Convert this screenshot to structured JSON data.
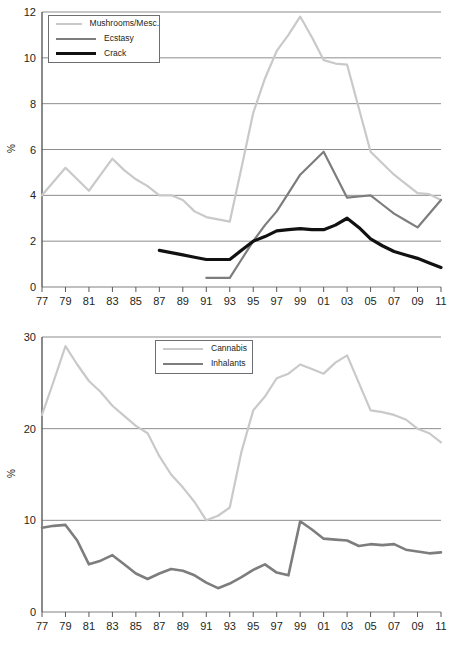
{
  "figure": {
    "background": "#ffffff",
    "colors": {
      "light_gray": "#c9c9c9",
      "medium_gray": "#7d7d7d",
      "black": "#111111",
      "gridline": "#808080",
      "axis": "#58595b",
      "text": "#231f20"
    }
  },
  "chart_data": [
    {
      "id": "top",
      "type": "line",
      "title": "",
      "xlabel": "",
      "ylabel": "%",
      "grid": true,
      "legend_position": "top-left",
      "xlim": [
        1977,
        2011
      ],
      "ylim": [
        0,
        12
      ],
      "yticks": [
        0,
        2,
        4,
        6,
        8,
        10,
        12
      ],
      "ytick_labels": [
        "0",
        "2",
        "4",
        "6",
        "8",
        "10",
        "12"
      ],
      "x": [
        1977,
        1978,
        1979,
        1980,
        1981,
        1982,
        1983,
        1984,
        1985,
        1986,
        1987,
        1988,
        1989,
        1990,
        1991,
        1992,
        1993,
        1994,
        1995,
        1996,
        1997,
        1998,
        1999,
        2000,
        2001,
        2002,
        2003,
        2004,
        2005,
        2006,
        2007,
        2008,
        2009,
        2010,
        2011
      ],
      "xtick_values": [
        1977,
        1979,
        1981,
        1983,
        1985,
        1987,
        1989,
        1991,
        1993,
        1995,
        1997,
        1999,
        2001,
        2003,
        2005,
        2007,
        2009,
        2011
      ],
      "xtick_labels": [
        "77",
        "79",
        "81",
        "83",
        "85",
        "87",
        "89",
        "91",
        "93",
        "95",
        "97",
        "99",
        "01",
        "03",
        "05",
        "07",
        "09",
        "11"
      ],
      "series": [
        {
          "name": "Mushrooms/Mesc.",
          "color": "#c9c9c9",
          "width": 2.2,
          "values": [
            4.0,
            4.6,
            5.2,
            4.7,
            4.2,
            4.9,
            5.6,
            5.1,
            4.7,
            4.4,
            4.0,
            4.0,
            3.8,
            3.3,
            3.05,
            2.95,
            2.85,
            5.2,
            7.6,
            9.1,
            10.3,
            11.0,
            11.8,
            10.9,
            9.9,
            9.75,
            9.7,
            7.8,
            5.9,
            5.4,
            4.9,
            4.5,
            4.1,
            4.05,
            3.8
          ]
        },
        {
          "name": "Ecstasy",
          "color": "#7d7d7d",
          "width": 2.2,
          "values": [
            null,
            null,
            null,
            null,
            null,
            null,
            null,
            null,
            null,
            null,
            null,
            null,
            null,
            null,
            0.4,
            0.4,
            0.4,
            1.2,
            2.0,
            2.7,
            3.3,
            4.1,
            4.9,
            5.4,
            5.9,
            4.9,
            3.9,
            3.95,
            4.0,
            3.6,
            3.2,
            2.9,
            2.6,
            3.2,
            3.8
          ]
        },
        {
          "name": "Crack",
          "color": "#111111",
          "width": 3.2,
          "values": [
            null,
            null,
            null,
            null,
            null,
            null,
            null,
            null,
            null,
            null,
            1.6,
            1.5,
            1.4,
            1.3,
            1.2,
            1.2,
            1.2,
            1.6,
            2.0,
            2.2,
            2.45,
            2.5,
            2.55,
            2.5,
            2.5,
            2.7,
            3.0,
            2.6,
            2.1,
            1.8,
            1.55,
            1.4,
            1.25,
            1.05,
            0.85
          ]
        }
      ]
    },
    {
      "id": "bottom",
      "type": "line",
      "title": "",
      "xlabel": "",
      "ylabel": "%",
      "grid": true,
      "legend_position": "top-center",
      "xlim": [
        1977,
        2011
      ],
      "ylim": [
        0,
        30
      ],
      "yticks": [
        0,
        10,
        20,
        30
      ],
      "ytick_labels": [
        "0",
        "10",
        "20",
        "30"
      ],
      "x": [
        1977,
        1978,
        1979,
        1980,
        1981,
        1982,
        1983,
        1984,
        1985,
        1986,
        1987,
        1988,
        1989,
        1990,
        1991,
        1992,
        1993,
        1994,
        1995,
        1996,
        1997,
        1998,
        1999,
        2000,
        2001,
        2002,
        2003,
        2004,
        2005,
        2006,
        2007,
        2008,
        2009,
        2010,
        2011
      ],
      "xtick_values": [
        1977,
        1979,
        1981,
        1983,
        1985,
        1987,
        1989,
        1991,
        1993,
        1995,
        1997,
        1999,
        2001,
        2003,
        2005,
        2007,
        2009,
        2011
      ],
      "xtick_labels": [
        "77",
        "79",
        "81",
        "83",
        "85",
        "87",
        "89",
        "91",
        "93",
        "95",
        "97",
        "99",
        "01",
        "03",
        "05",
        "07",
        "09",
        "11"
      ],
      "series": [
        {
          "name": "Cannabis",
          "color": "#c9c9c9",
          "width": 2.2,
          "values": [
            21.5,
            25.2,
            29.0,
            27.0,
            25.2,
            24.0,
            22.5,
            21.4,
            20.3,
            19.5,
            17.0,
            15.0,
            13.6,
            12.0,
            10.0,
            10.5,
            11.4,
            17.5,
            22.0,
            23.5,
            25.5,
            26.0,
            27.0,
            26.5,
            26.0,
            27.2,
            28.0,
            25.0,
            22.0,
            21.8,
            21.5,
            21.0,
            20.0,
            19.5,
            18.5
          ]
        },
        {
          "name": "Inhalants",
          "color": "#7d7d7d",
          "width": 2.6,
          "values": [
            9.2,
            9.4,
            9.5,
            7.8,
            5.2,
            5.6,
            6.2,
            5.2,
            4.2,
            3.6,
            4.2,
            4.7,
            4.5,
            4.0,
            3.2,
            2.6,
            3.1,
            3.8,
            4.6,
            5.2,
            4.3,
            4.0,
            9.9,
            9.0,
            8.0,
            7.9,
            7.8,
            7.2,
            7.4,
            7.3,
            7.4,
            6.8,
            6.6,
            6.4,
            6.5
          ]
        }
      ]
    }
  ]
}
